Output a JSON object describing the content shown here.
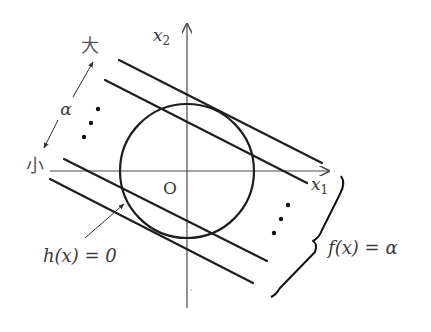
{
  "diagram": {
    "axes": {
      "x_label_base": "x",
      "x_label_sub": "1",
      "y_label_base": "x",
      "y_label_sub": "2",
      "origin_label": "O"
    },
    "labels": {
      "large": "大",
      "small": "小",
      "alpha": "α",
      "constraint_base": "h(x) = 0",
      "objective": "f(x) = α"
    },
    "constraint": {
      "shape": "circle",
      "center": [
        187,
        171
      ],
      "radius": 67
    },
    "level_lines": [
      {
        "id": "top",
        "from": [
          119,
          60
        ],
        "to": [
          322,
          163
        ]
      },
      {
        "id": "second",
        "from": [
          105,
          80
        ],
        "to": [
          307,
          183
        ]
      },
      {
        "id": "third",
        "from": [
          64,
          159
        ],
        "to": [
          267,
          261
        ]
      },
      {
        "id": "bottom",
        "from": [
          50,
          179
        ],
        "to": [
          253,
          283
        ]
      }
    ],
    "ellipsis_dots_left": [
      [
        98,
        109
      ],
      [
        91,
        123
      ],
      [
        84,
        137
      ]
    ],
    "ellipsis_dots_right": [
      [
        288,
        205
      ],
      [
        281,
        219
      ],
      [
        274,
        233
      ]
    ],
    "colors": {
      "line": "#1e1e1e",
      "axis": "#4a4a4a",
      "text": "#3a3a3a",
      "background": "#ffffff"
    }
  }
}
